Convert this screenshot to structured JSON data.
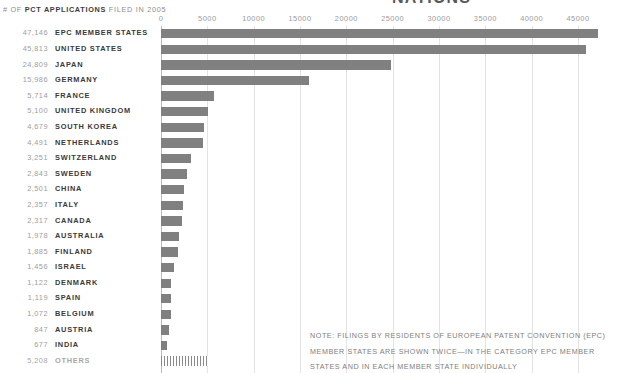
{
  "header": {
    "subtitle_prefix": "# OF ",
    "subtitle_strong": "PCT APPLICATIONS",
    "subtitle_suffix": " FILED IN 2005",
    "cropped_title": "NATIONS"
  },
  "note": {
    "line1": "NOTE: FILINGS BY RESIDENTS OF EUROPEAN PATENT CONVENTION (EPC)",
    "line2": "MEMBER STATES ARE SHOWN TWICE—IN THE CATEGORY EPC MEMBER",
    "line3": "STATES AND IN EACH MEMBER STATE INDIVIDUALLY"
  },
  "colors": {
    "bar": "#808080",
    "gridline": "#e3e3e3",
    "axis": "#b9b9b9",
    "value_text": "#9d9d9d",
    "label_text": "#3a3a3a",
    "note_text": "#7e7e7e"
  },
  "chart_data": {
    "type": "bar",
    "orientation": "horizontal",
    "title": "# OF PCT APPLICATIONS FILED IN 2005",
    "xlabel": "",
    "ylabel": "",
    "xlim": [
      0,
      47500
    ],
    "grid": true,
    "legend": false,
    "xticks": [
      0,
      5000,
      10000,
      15000,
      20000,
      25000,
      30000,
      35000,
      40000,
      45000
    ],
    "xtick_labels": [
      "0",
      "5000",
      "10000",
      "15000",
      "20000",
      "25000",
      "30000",
      "35000",
      "40000",
      "45000"
    ],
    "categories": [
      "EPC MEMBER STATES",
      "UNITED STATES",
      "JAPAN",
      "GERMANY",
      "FRANCE",
      "UNITED KINGDOM",
      "SOUTH KOREA",
      "NETHERLANDS",
      "SWITZERLAND",
      "SWEDEN",
      "CHINA",
      "ITALY",
      "CANADA",
      "AUSTRALIA",
      "FINLAND",
      "ISRAEL",
      "DENMARK",
      "SPAIN",
      "BELGIUM",
      "AUSTRIA",
      "INDIA",
      "OTHERS"
    ],
    "values": [
      47146,
      45813,
      24809,
      15986,
      5714,
      5100,
      4679,
      4491,
      3251,
      2843,
      2501,
      2357,
      2317,
      1978,
      1885,
      1456,
      1122,
      1119,
      1072,
      847,
      677,
      5208
    ],
    "value_labels": [
      "47,146",
      "45,813",
      "24,809",
      "15,986",
      "5,714",
      "5,100",
      "4,679",
      "4,491",
      "3,251",
      "2,843",
      "2,501",
      "2,357",
      "2,317",
      "1,978",
      "1,885",
      "1,456",
      "1,122",
      "1,119",
      "1,072",
      "847",
      "677",
      "5,208"
    ],
    "bar_styles": [
      "solid",
      "solid",
      "solid",
      "solid",
      "solid",
      "solid",
      "solid",
      "solid",
      "solid",
      "solid",
      "solid",
      "solid",
      "solid",
      "solid",
      "solid",
      "solid",
      "solid",
      "solid",
      "solid",
      "solid",
      "solid",
      "hatched"
    ]
  }
}
